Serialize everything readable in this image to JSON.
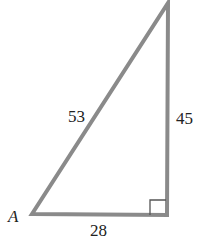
{
  "figure": {
    "type": "right-triangle",
    "stroke_color": "#8a8a8a",
    "vertex_label": "A",
    "sides": {
      "hypotenuse": "53",
      "vertical_leg": "45",
      "horizontal_leg": "28"
    },
    "right_angle_marker": true
  }
}
